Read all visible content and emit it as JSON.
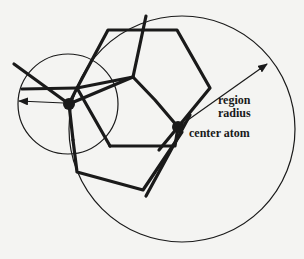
{
  "figure": {
    "labels": {
      "region_radius_line1": "region",
      "region_radius_line2": "radius",
      "center_atom": "center atom"
    },
    "colors": {
      "background": "#f4f4f2",
      "ink": "#1a1a1a"
    },
    "geometry": {
      "region_circle": {
        "cx": 182,
        "cy": 129,
        "r": 113
      },
      "small_circle": {
        "cx": 68,
        "cy": 104,
        "r": 50
      },
      "center_atom": {
        "cx": 178,
        "cy": 127,
        "r": 6
      },
      "neighbor_atom": {
        "cx": 69,
        "cy": 104,
        "r": 6
      }
    }
  }
}
